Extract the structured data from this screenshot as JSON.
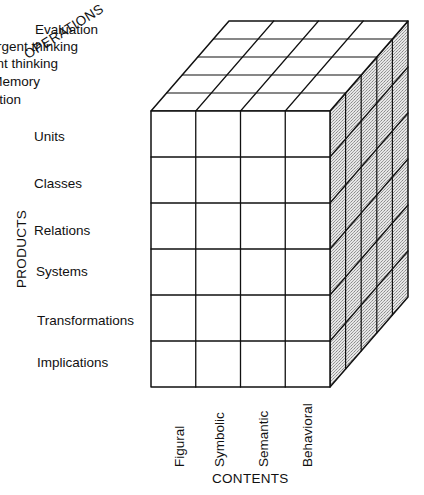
{
  "axes": {
    "operations": {
      "title": "OPERATIONS",
      "items": [
        "Cognition",
        "Memory",
        "Divergent thinking",
        "Convergent thinking",
        "Evaluation"
      ]
    },
    "products": {
      "title": "PRODUCTS",
      "items": [
        "Units",
        "Classes",
        "Relations",
        "Systems",
        "Transformations",
        "Implications"
      ]
    },
    "contents": {
      "title": "CONTENTS",
      "items": [
        "Figural",
        "Symbolic",
        "Semantic",
        "Behavioral"
      ]
    }
  },
  "colors": {
    "line": "#111111",
    "front_face": "#ffffff",
    "top_face": "#ffffff",
    "side_face": "#c9c9c9"
  }
}
